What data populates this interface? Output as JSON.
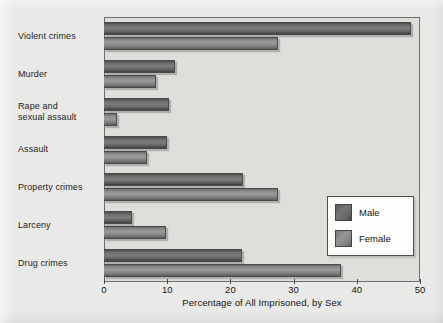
{
  "chart_data": {
    "type": "bar",
    "orientation": "horizontal",
    "title": "",
    "xlabel": "Percentage of All Imprisoned, by Sex",
    "ylabel": "",
    "xlim": [
      0,
      50
    ],
    "xticks": [
      0,
      10,
      20,
      30,
      40,
      50
    ],
    "xtick_labels": [
      "0",
      "10",
      "20",
      "30",
      "40",
      "50"
    ],
    "grid": false,
    "legend_position": "center-right",
    "categories": [
      "Violent crimes",
      "Murder",
      "Rape and\nsexual assault",
      "Assault",
      "Property crimes",
      "Larceny",
      "Drug crimes"
    ],
    "series": [
      {
        "name": "Male",
        "color": "#6f6f6f",
        "values": [
          48.5,
          11.2,
          10.3,
          10.0,
          22.0,
          4.5,
          21.8
        ]
      },
      {
        "name": "Female",
        "color": "#8d8d8d",
        "values": [
          27.5,
          8.2,
          2.0,
          6.8,
          27.5,
          9.8,
          37.5
        ]
      }
    ]
  },
  "legend": {
    "entries": [
      {
        "label": "Male"
      },
      {
        "label": "Female"
      }
    ]
  },
  "axis": {
    "x_title": "Percentage of All Imprisoned, by Sex",
    "x_tick_labels": [
      "0",
      "10",
      "20",
      "30",
      "40",
      "50"
    ]
  },
  "colors": {
    "page_background": "#e9e9e7",
    "plot_background": "#dededa",
    "male_bar": "#6f6f6f",
    "female_bar": "#8d8d8d",
    "frame": "#6e6e6e",
    "text": "#141414"
  }
}
